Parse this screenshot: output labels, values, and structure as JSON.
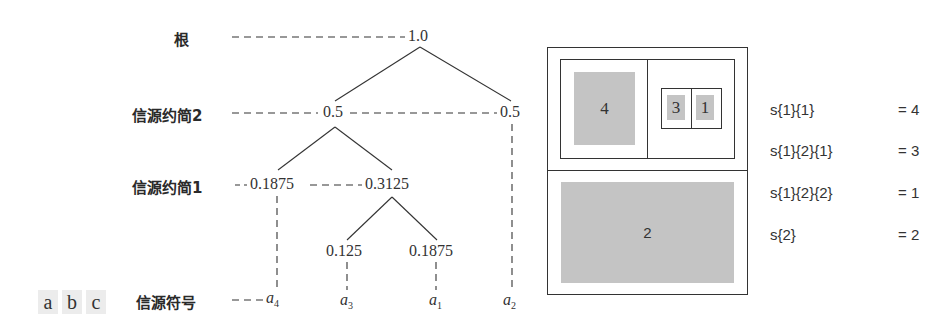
{
  "abc_chips": [
    "a",
    "b",
    "c"
  ],
  "tree": {
    "levels": {
      "root": "根",
      "reduction2": "信源约简2",
      "reduction1": "信源约简1",
      "symbols": "信源符号"
    },
    "nodes": {
      "root": "1.0",
      "r2_left": "0.5",
      "r2_right": "0.5",
      "r1_left": "0.1875",
      "r1_right": "0.3125",
      "leaf_a3": "0.125",
      "leaf_a1": "0.1875"
    },
    "symbols": [
      {
        "base": "a",
        "sub": "4"
      },
      {
        "base": "a",
        "sub": "3"
      },
      {
        "base": "a",
        "sub": "1"
      },
      {
        "base": "a",
        "sub": "2"
      }
    ]
  },
  "partition": {
    "cells": {
      "c4": "4",
      "c3": "3",
      "c1": "1",
      "c2": "2"
    },
    "fill_color": "#c4c4c4"
  },
  "code_list": [
    {
      "expr": "s{1}{1}",
      "eq": "= 4"
    },
    {
      "expr": "s{1}{2}{1}",
      "eq": "= 3"
    },
    {
      "expr": "s{1}{2}{2}",
      "eq": "= 1"
    },
    {
      "expr": "s{2}",
      "eq": "= 2"
    }
  ]
}
